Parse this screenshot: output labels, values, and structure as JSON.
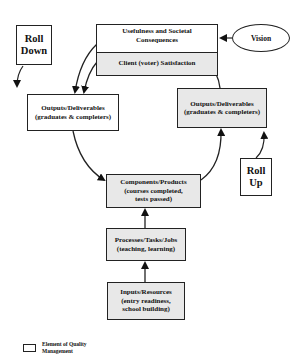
{
  "diagram": {
    "top_box": {
      "upper_label": [
        "Usefulness and Societal",
        "Consequences"
      ],
      "lower_label": "Client (voter) Satisfaction"
    },
    "vision": {
      "label": "Vision"
    },
    "roll_down": {
      "label": [
        "Roll",
        "Down"
      ]
    },
    "roll_up": {
      "label": [
        "Roll",
        "Up"
      ]
    },
    "outputs_left": {
      "label": [
        "Outputs/Deliverables",
        "(graduates & completers)"
      ]
    },
    "outputs_right": {
      "label": [
        "Outputs/Deliverables",
        "(graduates & completers)"
      ]
    },
    "components": {
      "label": [
        "Components/Products",
        "(courses completed,",
        "tests passed)"
      ]
    },
    "processes": {
      "label": [
        "Processes/Tasks/Jobs",
        "(teaching, learning)"
      ]
    },
    "inputs": {
      "label": [
        "Inputs/Resources",
        "(entry readiness,",
        "school building)"
      ]
    },
    "legend": {
      "label": [
        "Element of Quality",
        "Management"
      ]
    },
    "colors": {
      "shaded_fill": "#e8e8e8",
      "stroke": "#222222",
      "background": "#ffffff"
    }
  }
}
